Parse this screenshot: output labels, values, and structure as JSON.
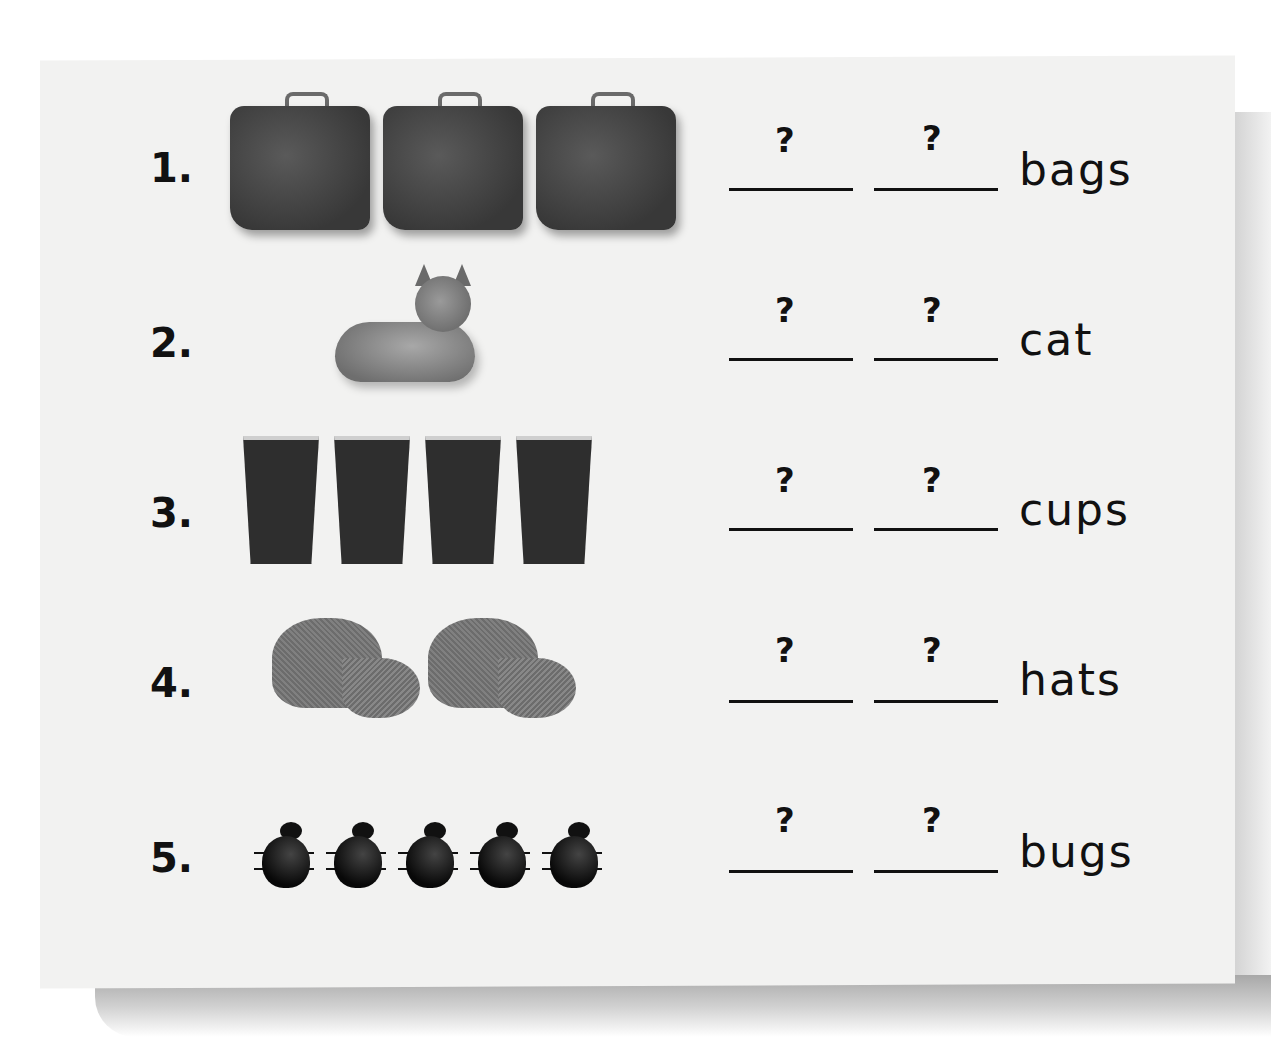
{
  "worksheet": {
    "blank_placeholder": "?",
    "rows": [
      {
        "number": "1.",
        "picture": "suitcase",
        "count": 3,
        "word": "bags"
      },
      {
        "number": "2.",
        "picture": "cat",
        "count": 1,
        "word": "cat"
      },
      {
        "number": "3.",
        "picture": "cup",
        "count": 4,
        "word": "cups"
      },
      {
        "number": "4.",
        "picture": "hat",
        "count": 2,
        "word": "hats"
      },
      {
        "number": "5.",
        "picture": "bug",
        "count": 5,
        "word": "bugs"
      }
    ]
  }
}
